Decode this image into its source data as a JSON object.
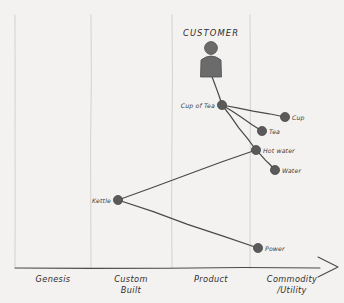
{
  "map": {
    "title_visible": false,
    "paper_color": "#f3f2f0",
    "ink_color": "#4a4a4a",
    "node_color": "#5a5a5a",
    "grid_color": "#c9c9c7",
    "axis_color": "#4a4a4a",
    "actor": {
      "label": "CUSTOMER",
      "icon": "person-icon",
      "x": 211,
      "y": 28,
      "icon_x": 211,
      "icon_head_y": 48,
      "icon_body_y": 64
    },
    "axis": {
      "orientation": "horizontal",
      "y": 268,
      "x_start": 15,
      "x_end": 338,
      "arrowhead": true,
      "stages": [
        {
          "label": "Genesis",
          "label_line2": "",
          "x": 53,
          "boundary_x": 15
        },
        {
          "label": "Custom",
          "label_line2": "Built",
          "x": 131,
          "boundary_x": 91
        },
        {
          "label": "Product",
          "label_line2": "",
          "x": 211,
          "boundary_x": 172
        },
        {
          "label": "Commodity",
          "label_line2": "/Utility",
          "x": 292,
          "boundary_x": 250
        }
      ],
      "gridline_top": 15
    },
    "nodes": [
      {
        "id": "cup_of_tea",
        "label": "Cup of Tea",
        "x": 222,
        "y": 105,
        "label_side": "left",
        "stage": "Product"
      },
      {
        "id": "cup",
        "label": "Cup",
        "x": 285,
        "y": 117,
        "label_side": "right",
        "stage": "Commodity/Utility"
      },
      {
        "id": "tea",
        "label": "Tea",
        "x": 262,
        "y": 131,
        "label_side": "right",
        "stage": "Commodity/Utility"
      },
      {
        "id": "hot_water",
        "label": "Hot water",
        "x": 256,
        "y": 150,
        "label_side": "right",
        "stage": "Commodity/Utility"
      },
      {
        "id": "water",
        "label": "Water",
        "x": 275,
        "y": 170,
        "label_side": "right",
        "stage": "Commodity/Utility"
      },
      {
        "id": "kettle",
        "label": "Kettle",
        "x": 118,
        "y": 200,
        "label_side": "left",
        "stage": "Custom Built"
      },
      {
        "id": "power",
        "label": "Power",
        "x": 258,
        "y": 248,
        "label_side": "right",
        "stage": "Commodity/Utility"
      }
    ],
    "links": [
      {
        "from": "customer",
        "to": "cup_of_tea"
      },
      {
        "from": "cup_of_tea",
        "to": "cup"
      },
      {
        "from": "cup_of_tea",
        "to": "tea"
      },
      {
        "from": "cup_of_tea",
        "to": "hot_water"
      },
      {
        "from": "hot_water",
        "to": "water"
      },
      {
        "from": "kettle",
        "to": "hot_water"
      },
      {
        "from": "kettle",
        "to": "power"
      }
    ]
  }
}
